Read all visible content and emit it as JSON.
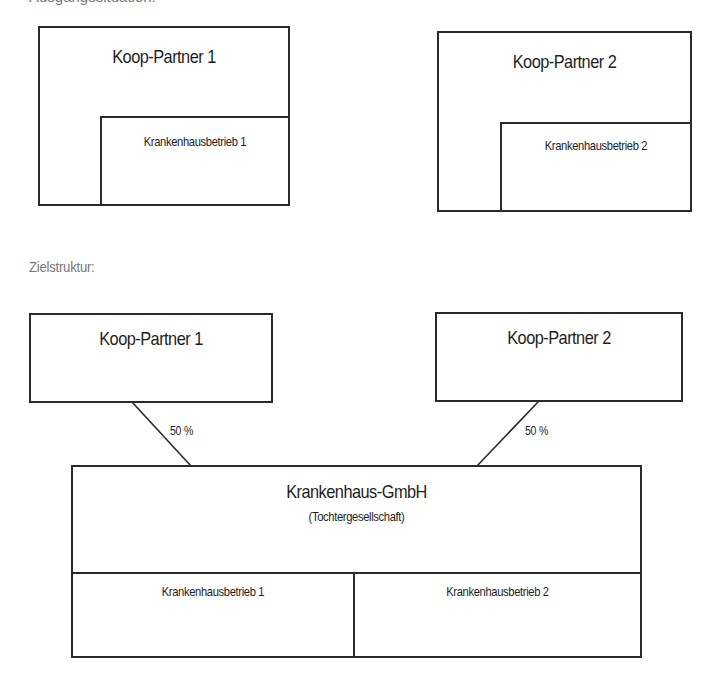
{
  "sections": {
    "current_label_cut": "Ausgangssituation:",
    "target_label": "Zielstruktur:"
  },
  "current": {
    "partner1": {
      "title": "Koop-Partner 1",
      "unit": "Krankenhausbetrieb 1"
    },
    "partner2": {
      "title": "Koop-Partner 2",
      "unit": "Krankenhausbetrieb 2"
    }
  },
  "target": {
    "partner1": {
      "title": "Koop-Partner 1",
      "share": "50 %"
    },
    "partner2": {
      "title": "Koop-Partner 2",
      "share": "50 %"
    },
    "subsidiary": {
      "title": "Krankenhaus-GmbH",
      "subtitle": "(Tochtergesellschaft)",
      "units": [
        "Krankenhausbetrieb 1",
        "Krankenhausbetrieb 2"
      ]
    }
  },
  "colors": {
    "line": "#2a2a2a",
    "label_gray": "#777777"
  }
}
